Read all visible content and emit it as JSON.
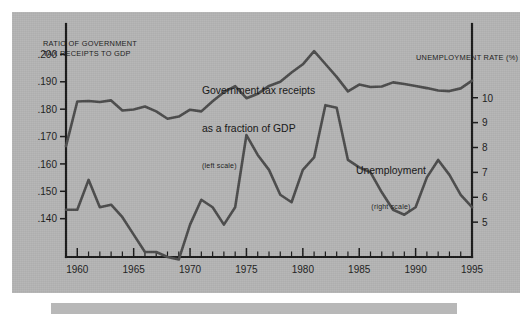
{
  "figure": {
    "panel_color": "#b5b5b5",
    "line_color": "#4c4c4c",
    "axis_color": "#1a1a1a",
    "left_axis_title": "RATIO OF GOVERNMENT\nTAX RECEIPTS TO GDP",
    "right_axis_title": "UNEMPLOYMENT RATE (%)",
    "annotations": {
      "tax_line1": "Government tax receipts",
      "tax_line2": "as a fraction of GDP",
      "tax_scale_note": "(left scale)",
      "unemployment_label": "Unemployment",
      "unemployment_scale_note": "(right scale)"
    }
  },
  "chart_data": {
    "type": "line",
    "title": "",
    "xlabel": "",
    "ylabel": "Ratio of government tax receipts to GDP",
    "y2label": "Unemployment rate (%)",
    "grid": false,
    "legend": "inline-annotations",
    "xlim": [
      1959,
      1995
    ],
    "xticks": [
      1960,
      1965,
      1970,
      1975,
      1980,
      1985,
      1990,
      1995
    ],
    "xtick_labels": [
      "1960",
      "1965",
      "1970",
      "1975",
      "1980",
      "1985",
      "1990",
      "1995"
    ],
    "xtick_minor_step": 1,
    "ylim": [
      0.126,
      0.206
    ],
    "yticks": [
      0.2,
      0.19,
      0.18,
      0.17,
      0.16,
      0.15,
      0.14
    ],
    "ytick_labels": [
      ".200",
      ".190",
      ".180",
      ".170",
      ".160",
      ".150",
      ".140"
    ],
    "y2lim": [
      3.6,
      12.4
    ],
    "y2ticks": [
      10,
      9,
      8,
      7,
      6,
      5
    ],
    "y2tick_labels": [
      "10",
      "9",
      "8",
      "7",
      "6",
      "5"
    ],
    "x": [
      1959,
      1960,
      1961,
      1962,
      1963,
      1964,
      1965,
      1966,
      1967,
      1968,
      1969,
      1970,
      1971,
      1972,
      1973,
      1974,
      1975,
      1976,
      1977,
      1978,
      1979,
      1980,
      1981,
      1982,
      1983,
      1984,
      1985,
      1986,
      1987,
      1988,
      1989,
      1990,
      1991,
      1992,
      1993,
      1994,
      1995
    ],
    "series": [
      {
        "name": "Government tax receipts as a fraction of GDP",
        "axis": "left",
        "values": [
          0.1665,
          0.1828,
          0.183,
          0.1826,
          0.1832,
          0.1795,
          0.1799,
          0.181,
          0.1792,
          0.1765,
          0.1773,
          0.1798,
          0.1792,
          0.1829,
          0.1862,
          0.1884,
          0.184,
          0.1856,
          0.1885,
          0.19,
          0.1934,
          0.1964,
          0.2012,
          0.1965,
          0.1918,
          0.1865,
          0.189,
          0.1881,
          0.1883,
          0.1898,
          0.1892,
          0.1885,
          0.1877,
          0.1868,
          0.1866,
          0.1876,
          0.1904
        ]
      },
      {
        "name": "Unemployment rate",
        "axis": "right",
        "values": [
          5.5,
          5.5,
          6.7,
          5.6,
          5.7,
          5.2,
          4.5,
          3.8,
          3.8,
          3.6,
          3.5,
          4.9,
          5.9,
          5.6,
          4.9,
          5.6,
          8.5,
          7.7,
          7.1,
          6.1,
          5.8,
          7.1,
          7.6,
          9.7,
          9.6,
          7.5,
          7.2,
          7.0,
          6.2,
          5.5,
          5.3,
          5.6,
          6.8,
          7.5,
          6.9,
          6.1,
          5.6
        ]
      }
    ]
  }
}
